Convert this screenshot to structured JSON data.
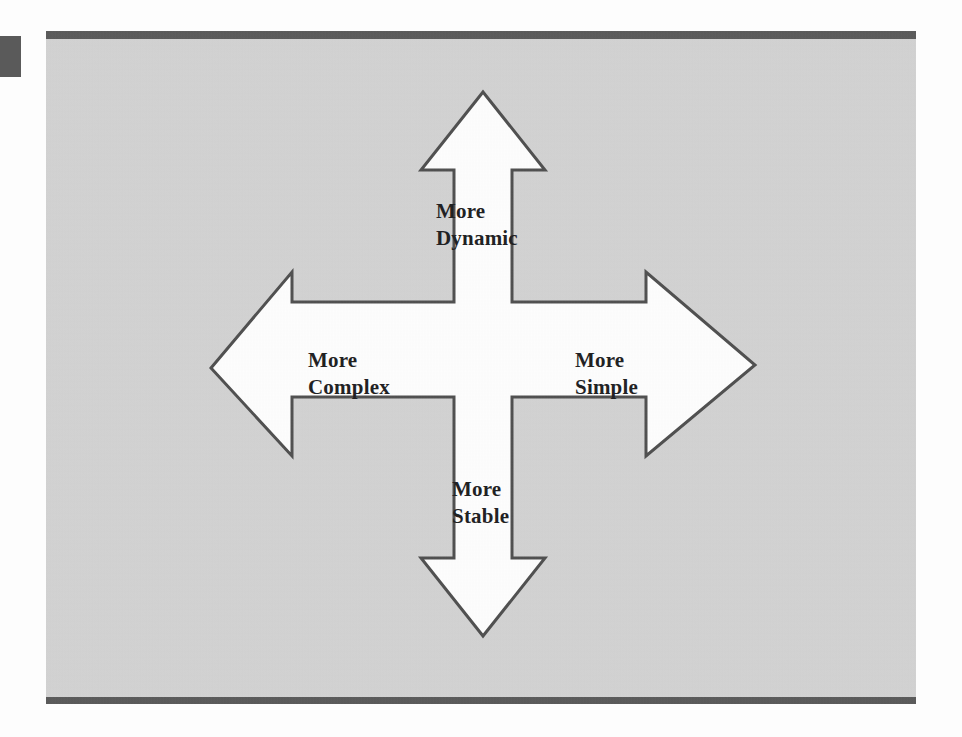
{
  "figure": {
    "type": "four-headed-arrow-diagram",
    "caption": "",
    "background_color": "#d2d2d2",
    "shape_fill": "#ffffff",
    "shape_stroke": "#4a4a4a",
    "rule_color": "#555555",
    "labels": {
      "top": "More\nDynamic",
      "left": "More\nComplex",
      "right": "More\nSimple",
      "bottom": "More\nStable"
    },
    "axes": {
      "vertical": "Dynamic — Stable",
      "horizontal": "Complex — Simple"
    }
  },
  "chart_data": {
    "type": "diagram",
    "title": "",
    "subtype": "four-headed arrow / cross axes",
    "arrows": [
      {
        "direction": "up",
        "label": "More Dynamic",
        "tip": [
          483,
          92
        ],
        "label_lines": [
          "More",
          "Dynamic"
        ]
      },
      {
        "direction": "left",
        "label": "More Complex",
        "tip": [
          211,
          368
        ],
        "label_lines": [
          "More",
          "Complex"
        ]
      },
      {
        "direction": "right",
        "label": "More Simple",
        "tip": [
          755,
          365
        ],
        "label_lines": [
          "More",
          "Simple"
        ]
      },
      {
        "direction": "down",
        "label": "More Stable",
        "tip": [
          487,
          636
        ],
        "label_lines": [
          "More",
          "Stable"
        ]
      }
    ],
    "legend": [],
    "annotations": [
      "More Dynamic",
      "More Complex",
      "More Simple",
      "More Stable"
    ]
  }
}
